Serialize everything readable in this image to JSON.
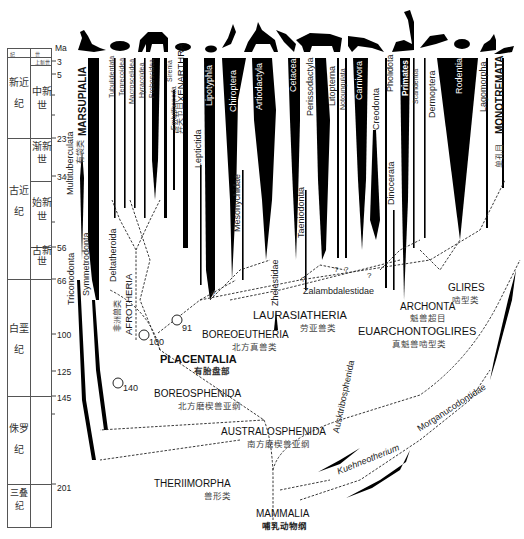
{
  "timescale": {
    "unit_label": "Ma",
    "header": {
      "period": "纪",
      "epoch": "世"
    },
    "periods": [
      {
        "name": "新近纪",
        "top": 3,
        "bottom": 23
      },
      {
        "name": "古近纪",
        "top": 23,
        "bottom": 66
      },
      {
        "name": "白垩纪",
        "top": 66,
        "bottom": 145
      },
      {
        "name": "侏罗纪",
        "top": 145,
        "bottom": 201
      },
      {
        "name": "三叠纪",
        "top": 201,
        "bottom": null
      }
    ],
    "epochs": [
      {
        "name": "上新世",
        "top": 3,
        "bottom": 5
      },
      {
        "name": "中新世",
        "top": 5,
        "bottom": 23
      },
      {
        "name": "渐新世",
        "top": 23,
        "bottom": 34
      },
      {
        "name": "始新世",
        "top": 34,
        "bottom": 56
      },
      {
        "name": "古新世",
        "top": 56,
        "bottom": 66
      }
    ],
    "ticks": [
      "3",
      "5",
      "23",
      "34",
      "56",
      "66",
      "100",
      "125",
      "145",
      "201"
    ]
  },
  "taxa": {
    "multituberculata": "Multituberculata",
    "marsupialia": "MARSUPIALIA",
    "marsupialia_cn": "有袋类",
    "symmetrodonta": "Symmetrodonta",
    "triconodonta": "Triconodonta",
    "deltatheroida": "Deltatheroida",
    "tubulidentata": "Tubulidentata",
    "tenrecoidea": "Tenrecoidea",
    "macroscelidea": "Macroscelidea",
    "hyracoidea": "Hyracoidea",
    "proboscidea": "Proboscidea",
    "sirenia": "Sirenia",
    "embrithopoda": "Embrithopoda",
    "xenarthra": "XENARTHRA",
    "xenarthra_cn": "异关节目",
    "leptictida": "Leptictida",
    "lipotyphla": "Lipotyphla",
    "chiroptera": "Chiroptera",
    "mesonychidae": "Mesonychidae",
    "artiodactyla": "Artiodactyla",
    "cetacea": "Cetacea",
    "zhelestidae": "Zhelestidae",
    "taeniodontia": "Taeniodontia",
    "perissodactyla": "Perissodactyla",
    "litopterna": "Litopterna",
    "notoungulata": "Notoungulata",
    "carnivora": "Carnivora",
    "creodonta": "Creodonta",
    "zalambdalestidae": "Zalambdalestidae",
    "dinocerata": "Dinocerata",
    "pholidota": "Pholidota",
    "primates": "Primates",
    "scandentia": "Scandentia",
    "dermoptera": "Dermoptera",
    "rodentia": "Rodentia",
    "lagomorpha": "Lagomorpha",
    "monotremata": "MONOTREMATA",
    "monotremata_cn": "单孔目",
    "ausktribosphenida": "Ausktribosphenida",
    "kuehneotherium": "Kuehneotherium",
    "morganucodontidae": "Morganucodontidae"
  },
  "clades": {
    "afrotheria": {
      "name": "AFROTHERIA",
      "cn": "非洲兽类"
    },
    "boreoeutheria": {
      "name": "BOREOEUTHERIA",
      "cn": "北方真兽类"
    },
    "laurasiatheria": {
      "name": "LAURASIATHERIA",
      "cn": "劳亚兽类"
    },
    "euarchontoglires": {
      "name": "EUARCHONTOGLIRES",
      "cn": "真魁兽啮型类"
    },
    "archonta": {
      "name": "ARCHONTA",
      "cn": "魁兽超目"
    },
    "glires": {
      "name": "GLIRES",
      "cn": "啮型类"
    },
    "placentalia": {
      "name": "PLACENTALIA",
      "cn": "有胎盘部"
    },
    "boreosphenida": {
      "name": "BOREOSPHENIDA",
      "cn": "北方磨楔兽亚纲"
    },
    "australosphenida": {
      "name": "AUSTRALOSPHENIDA",
      "cn": "南方磨楔兽亚纲"
    },
    "theriimorpha": {
      "name": "THERIIMORPHA",
      "cn": "兽形类"
    },
    "mammalia": {
      "name": "MAMMALIA",
      "cn": "哺乳动物纲"
    }
  },
  "node_ages": {
    "n140": "140",
    "n100": "100",
    "n91": "91"
  },
  "uncertain_mark": "?",
  "silhouettes": [
    "kangaroo",
    "aardvark",
    "elephant",
    "armadillo",
    "hedgehog",
    "bat",
    "deer",
    "dolphin",
    "rhinoceros",
    "wolf",
    "lemur",
    "colugo",
    "rat",
    "rabbit",
    "platypus"
  ]
}
